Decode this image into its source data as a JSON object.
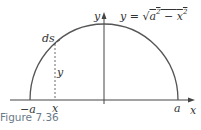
{
  "figure": {
    "caption": "Figure 7.36",
    "equation": {
      "lhs": "y = ",
      "radical": "√",
      "a": "a",
      "a_exp": "2",
      "minus": " − ",
      "x": "x",
      "x_exp": "2"
    },
    "labels": {
      "y_axis": "y",
      "x_axis": "x",
      "ds": "ds",
      "y_segment": "y",
      "neg_a": "−a",
      "x_tick": "x",
      "a": "a"
    },
    "colors": {
      "curve": "#555555",
      "axis": "#444444",
      "caption": "#6a7a8a"
    }
  }
}
